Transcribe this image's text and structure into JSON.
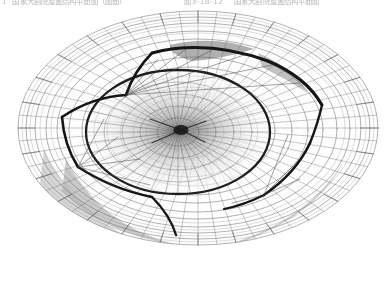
{
  "page": {
    "background_color": "#ffffff",
    "ink_color": "#555555"
  },
  "header": {
    "folio": "1",
    "left_text": "国家大剧院屋盖结构平面图",
    "left_paren": "（图面）",
    "figure_number": "图3-18-12",
    "right_text": "国家大剧院屋盖结构平面图"
  },
  "figure": {
    "name": "national-grand-theatre-roof-structure",
    "stroke_color": "#4a4a4a",
    "panel_fill_light": "#d8d8d8",
    "panel_fill_mid": "#b4b4b4",
    "panel_fill_dark": "#8c8c8c",
    "geometry": {
      "outer_ellipse_cx": 198,
      "outer_ellipse_cy": 128,
      "outer_ellipse_rx": 180,
      "outer_ellipse_ry": 118,
      "rings": [
        1.0,
        0.93,
        0.86,
        0.8,
        0.72,
        0.62,
        0.5,
        0.38,
        0.27,
        0.17
      ],
      "radial_spokes": 72,
      "inner_hub_cx": 178,
      "inner_hub_cy": 132,
      "inner_hub_rx": 92,
      "inner_hub_ry": 62
    }
  },
  "caption": {
    "text": ""
  }
}
